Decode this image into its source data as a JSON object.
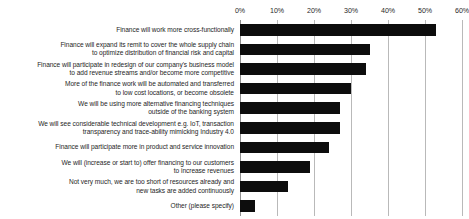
{
  "chart_data": {
    "type": "bar",
    "orientation": "horizontal",
    "title": "",
    "subtitle": "",
    "xlabel": "",
    "ylabel": "",
    "xlim": [
      0,
      60
    ],
    "grid": true,
    "legend": false,
    "axis_tick_labels": [
      "0%",
      "10%",
      "20%",
      "30%",
      "40%",
      "50%",
      "60%"
    ],
    "axis_tick_values": [
      0,
      10,
      20,
      30,
      40,
      50,
      60
    ],
    "bar_color": "#0d0d0d",
    "gridline_color": "#b9b9b9",
    "text_color": "#262626",
    "categories": [
      "Finance will work more cross-functionally",
      "Finance will expand its remit to cover the whole supply chain to optimize distribution of financial risk and capital",
      "Finance will participate in redesign of our company's business model to add revenue streams and/or become more competitive",
      "More of the finance work will be automated and transferred to low cost locations, or become obsolete",
      "We will be using more alternative financing techniques outside of the banking system",
      "We will see considerable technical development e.g. IoT, transaction transparency and trace-ability mimicking Industry 4.0",
      "Finance will participate more in product and service innovation",
      "We will (increase or start to) offer financing to our customers to increase revenues",
      "Not very much, we are too short of resources already and new tasks are added continuously",
      "Other (please specify)"
    ],
    "category_lines": [
      [
        "Finance will work more cross-functionally"
      ],
      [
        "Finance will expand its remit to cover the whole supply chain",
        "to optimize distribution of financial risk and capital"
      ],
      [
        "Finance will participate in redesign of our company's business model",
        "to add revenue streams and/or become more competitive"
      ],
      [
        "More of the finance work will be automated and transferred",
        "to low cost locations, or become obsolete"
      ],
      [
        "We will be using more alternative financing techniques",
        "outside of the banking system"
      ],
      [
        "We will see considerable technical development e.g. IoT, transaction",
        "transparency and trace-ability mimicking Industry 4.0"
      ],
      [
        "Finance will participate more in product and service innovation"
      ],
      [
        "We will (increase or start to) offer financing to our customers",
        "to increase revenues"
      ],
      [
        "Not very much, we are too short of resources already and",
        "new tasks are added continuously"
      ],
      [
        "Other (please specify)"
      ]
    ],
    "values": [
      53,
      35,
      34,
      30,
      27,
      27,
      24,
      19,
      13,
      4
    ]
  }
}
